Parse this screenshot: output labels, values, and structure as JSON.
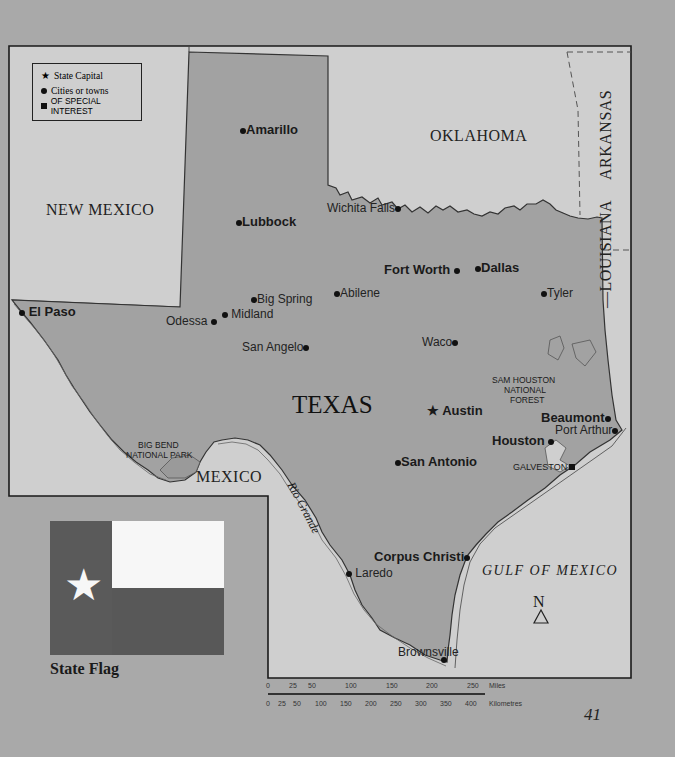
{
  "map": {
    "title": "TEXAS",
    "legend": [
      {
        "symbol": "star",
        "label": "State Capital"
      },
      {
        "symbol": "circle",
        "label": "Cities or towns"
      },
      {
        "symbol": "square",
        "label": "OF SPECIAL INTEREST"
      }
    ],
    "regions": {
      "new_mexico": "NEW MEXICO",
      "oklahoma": "OKLAHOMA",
      "arkansas": "ARKANSAS",
      "louisiana": "LOUISIANA",
      "mexico": "MEXICO",
      "gulf": "GULF OF MEXICO",
      "state": "TEXAS"
    },
    "river": "Rio Grande",
    "cities": {
      "capital": "Austin",
      "major": [
        "Amarillo",
        "Lubbock",
        "El Paso",
        "Fort Worth",
        "Dallas",
        "San Antonio",
        "Houston",
        "Beaumont",
        "Corpus Christi"
      ],
      "minor": [
        "Wichita Falls",
        "Abilene",
        "Big Spring",
        "Midland",
        "Odessa",
        "San Angelo",
        "Tyler",
        "Waco",
        "Port Arthur",
        "Laredo",
        "Brownsville"
      ]
    },
    "special_interest": {
      "galveston": "GALVESTON",
      "big_bend_1": "BIG BEND",
      "big_bend_2": "NATIONAL PARK",
      "sam_houston_1": "SAM HOUSTON",
      "sam_houston_2": "NATIONAL",
      "sam_houston_3": "FOREST"
    },
    "north_arrow": "N",
    "scale": {
      "miles_label": "Miles",
      "km_label": "Kilometres",
      "miles": [
        "0",
        "25",
        "50",
        "100",
        "150",
        "200",
        "250"
      ],
      "km": [
        "0",
        "25",
        "50",
        "100",
        "150",
        "200",
        "250",
        "300",
        "350",
        "400"
      ]
    }
  },
  "flag": {
    "caption": "State Flag",
    "colors": {
      "blue": "#5a5a5a",
      "white": "#f7f7f7",
      "red": "#585858"
    }
  },
  "page_number": "41",
  "colors": {
    "page": "#a9a9a9",
    "neighbor_land": "#cfcfcf",
    "texas": "#a2a2a2",
    "border": "#222222"
  }
}
